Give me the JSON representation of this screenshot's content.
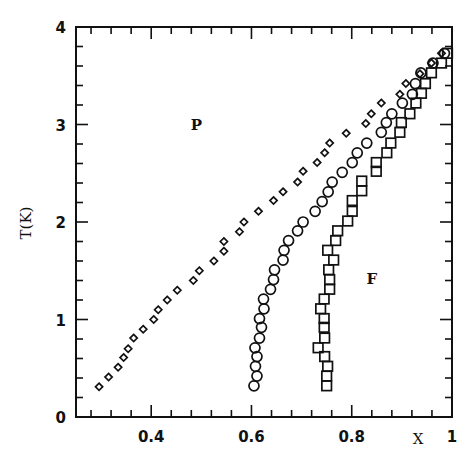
{
  "chart_data": {
    "type": "scatter",
    "title": "",
    "xlabel": "X",
    "ylabel": "T(K)",
    "xlim": [
      0.25,
      1.0
    ],
    "ylim": [
      0,
      4
    ],
    "grid": false,
    "legend": "none",
    "x_ticks": [
      {
        "value": 0.4,
        "label": "0.4"
      },
      {
        "value": 0.6,
        "label": "0.6"
      },
      {
        "value": 0.8,
        "label": "0.8"
      },
      {
        "value": 1.0,
        "label": "1"
      }
    ],
    "x_minor_step": 0.04,
    "y_ticks": [
      {
        "value": 0,
        "label": "0"
      },
      {
        "value": 1,
        "label": "1"
      },
      {
        "value": 2,
        "label": "2"
      },
      {
        "value": 3,
        "label": "3"
      },
      {
        "value": 4,
        "label": "4"
      }
    ],
    "y_minor_step": 0.2,
    "annotations": [
      {
        "text": "P",
        "x": 0.49,
        "y": 3.0
      },
      {
        "text": "F",
        "x": 0.84,
        "y": 1.42
      }
    ],
    "series": [
      {
        "name": "diamonds",
        "marker": "diamond",
        "points": [
          [
            0.296,
            0.31
          ],
          [
            0.315,
            0.41
          ],
          [
            0.334,
            0.51
          ],
          [
            0.345,
            0.61
          ],
          [
            0.354,
            0.7
          ],
          [
            0.365,
            0.81
          ],
          [
            0.384,
            0.9
          ],
          [
            0.405,
            1.0
          ],
          [
            0.414,
            1.1
          ],
          [
            0.432,
            1.2
          ],
          [
            0.452,
            1.3
          ],
          [
            0.484,
            1.4
          ],
          [
            0.496,
            1.5
          ],
          [
            0.525,
            1.6
          ],
          [
            0.545,
            1.7
          ],
          [
            0.545,
            1.8
          ],
          [
            0.576,
            1.9
          ],
          [
            0.585,
            2.0
          ],
          [
            0.614,
            2.11
          ],
          [
            0.644,
            2.22
          ],
          [
            0.663,
            2.31
          ],
          [
            0.692,
            2.41
          ],
          [
            0.703,
            2.52
          ],
          [
            0.731,
            2.61
          ],
          [
            0.746,
            2.71
          ],
          [
            0.756,
            2.81
          ],
          [
            0.789,
            2.91
          ],
          [
            0.828,
            3.01
          ],
          [
            0.839,
            3.11
          ],
          [
            0.859,
            3.22
          ],
          [
            0.896,
            3.31
          ],
          [
            0.908,
            3.42
          ],
          [
            0.936,
            3.52
          ],
          [
            0.959,
            3.63
          ],
          [
            0.979,
            3.73
          ]
        ]
      },
      {
        "name": "circles",
        "marker": "circle",
        "points": [
          [
            0.605,
            0.32
          ],
          [
            0.611,
            0.42
          ],
          [
            0.608,
            0.52
          ],
          [
            0.611,
            0.62
          ],
          [
            0.607,
            0.71
          ],
          [
            0.616,
            0.81
          ],
          [
            0.62,
            0.92
          ],
          [
            0.616,
            1.01
          ],
          [
            0.625,
            1.11
          ],
          [
            0.624,
            1.21
          ],
          [
            0.638,
            1.31
          ],
          [
            0.644,
            1.41
          ],
          [
            0.646,
            1.51
          ],
          [
            0.663,
            1.61
          ],
          [
            0.665,
            1.71
          ],
          [
            0.674,
            1.81
          ],
          [
            0.692,
            1.91
          ],
          [
            0.703,
            2.0
          ],
          [
            0.727,
            2.11
          ],
          [
            0.741,
            2.21
          ],
          [
            0.753,
            2.31
          ],
          [
            0.761,
            2.41
          ],
          [
            0.781,
            2.51
          ],
          [
            0.801,
            2.61
          ],
          [
            0.811,
            2.71
          ],
          [
            0.83,
            2.81
          ],
          [
            0.859,
            2.92
          ],
          [
            0.869,
            3.02
          ],
          [
            0.88,
            3.11
          ],
          [
            0.901,
            3.22
          ],
          [
            0.921,
            3.31
          ],
          [
            0.927,
            3.42
          ],
          [
            0.938,
            3.53
          ],
          [
            0.962,
            3.63
          ],
          [
            0.985,
            3.73
          ]
        ]
      },
      {
        "name": "squares",
        "marker": "square",
        "points": [
          [
            0.75,
            0.32
          ],
          [
            0.75,
            0.42
          ],
          [
            0.752,
            0.52
          ],
          [
            0.746,
            0.62
          ],
          [
            0.733,
            0.71
          ],
          [
            0.746,
            0.81
          ],
          [
            0.745,
            0.92
          ],
          [
            0.745,
            1.01
          ],
          [
            0.738,
            1.11
          ],
          [
            0.745,
            1.21
          ],
          [
            0.756,
            1.31
          ],
          [
            0.756,
            1.41
          ],
          [
            0.754,
            1.51
          ],
          [
            0.764,
            1.61
          ],
          [
            0.752,
            1.71
          ],
          [
            0.768,
            1.81
          ],
          [
            0.772,
            1.91
          ],
          [
            0.792,
            2.01
          ],
          [
            0.801,
            2.11
          ],
          [
            0.801,
            2.22
          ],
          [
            0.82,
            2.32
          ],
          [
            0.82,
            2.42
          ],
          [
            0.849,
            2.52
          ],
          [
            0.849,
            2.61
          ],
          [
            0.87,
            2.71
          ],
          [
            0.878,
            2.81
          ],
          [
            0.896,
            2.92
          ],
          [
            0.899,
            3.02
          ],
          [
            0.916,
            3.11
          ],
          [
            0.928,
            3.22
          ],
          [
            0.939,
            3.32
          ],
          [
            0.947,
            3.42
          ],
          [
            0.959,
            3.53
          ],
          [
            0.979,
            3.63
          ],
          [
            0.991,
            3.73
          ]
        ]
      }
    ]
  }
}
